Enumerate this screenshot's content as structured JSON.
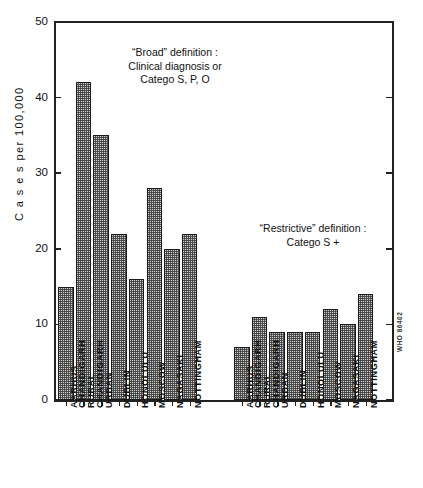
{
  "chart_data": {
    "type": "bar",
    "title": "",
    "xlabel": "",
    "ylabel": "Cases per 100,000",
    "ylim": [
      0,
      50
    ],
    "yticks": [
      0,
      10,
      20,
      30,
      40,
      50
    ],
    "ytick_labels": [
      "0",
      "10",
      "20",
      "30",
      "40",
      "50"
    ],
    "grid": false,
    "legend_position": "none",
    "categories": [
      "AARHUS",
      "CHANDIGARH RURAL",
      "CHANDIGARH URBAN",
      "DUBLIN",
      "HONOLULU",
      "MOSCOW",
      "NAGASAKI",
      "NOTTINGHAM"
    ],
    "series": [
      {
        "name": "\"Broad\" definition : Clinical diagnosis or Catego S, P, O",
        "values": [
          15,
          42,
          35,
          22,
          16,
          28,
          20,
          22
        ]
      },
      {
        "name": "\"Restrictive\" definition : Catego S +",
        "values": [
          7,
          11,
          9,
          9,
          9,
          12,
          10,
          14
        ]
      }
    ],
    "annotations": [
      {
        "id": "broad",
        "lines": [
          "“Broad” definition :",
          "Clinical diagnosis or",
          "Catego S, P, O"
        ]
      },
      {
        "id": "restrictive",
        "lines": [
          "“Restrictive” definition :",
          "Catego S +"
        ]
      }
    ],
    "source_code": "WHO 86402"
  },
  "axis": {
    "y_title": "C a s e s   per  100,000"
  },
  "xlabels": [
    {
      "l1": "AARHUS",
      "l2": ""
    },
    {
      "l1": "CHANDIGARH",
      "l2": "RURAL"
    },
    {
      "l1": "CHANDIGARH",
      "l2": "URBAN"
    },
    {
      "l1": "DUBLIN",
      "l2": ""
    },
    {
      "l1": "HONOLULU",
      "l2": ""
    },
    {
      "l1": "MOSCOW",
      "l2": ""
    },
    {
      "l1": "NAGASAKI",
      "l2": ""
    },
    {
      "l1": "NOTTINGHAM",
      "l2": ""
    }
  ],
  "colors": {
    "axis": "#222222",
    "bar_fill": "#cfcfcf",
    "bar_edge": "#1a1a1a",
    "text": "#111111",
    "background": "#ffffff"
  }
}
